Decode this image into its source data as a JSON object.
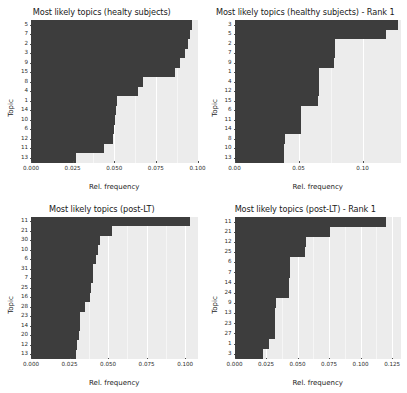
{
  "figure": {
    "background": "#ffffff",
    "panel_background": "#ececec",
    "bar_color": "#3d3d3d",
    "gridline_color": "#ffffff"
  },
  "chart_data": [
    {
      "id": "healthy-subjects",
      "type": "bar",
      "orientation": "horizontal",
      "title": "Most likely topics (healty subjects)",
      "xlabel": "Rel. frequency",
      "ylabel": "Topic",
      "xlim": [
        0,
        0.1
      ],
      "xticks": [
        0,
        0.025,
        0.05,
        0.075,
        0.1
      ],
      "xticklabels": [
        "0.000",
        "0.025",
        "0.050",
        "0.075",
        "0.100"
      ],
      "grid": true,
      "legend": "none",
      "categories": [
        "5",
        "7",
        "2",
        "3",
        "9",
        "15",
        "8",
        "4",
        "1",
        "14",
        "10",
        "6",
        "12",
        "11",
        "13"
      ],
      "values": [
        0.0965,
        0.0955,
        0.0945,
        0.0925,
        0.0895,
        0.0865,
        0.0675,
        0.0645,
        0.0515,
        0.051,
        0.0505,
        0.05,
        0.049,
        0.044,
        0.027
      ]
    },
    {
      "id": "healthy-subjects-rank1",
      "type": "bar",
      "orientation": "horizontal",
      "title": "Most likely topics (healthy subjects) - Rank 1",
      "xlabel": "Rel. frequency",
      "ylabel": "Topic",
      "xlim": [
        0,
        0.13
      ],
      "xticks": [
        0,
        0.05,
        0.1
      ],
      "xticklabels": [
        "0.00",
        "0.05",
        "0.10"
      ],
      "grid": true,
      "legend": "none",
      "categories": [
        "3",
        "5",
        "2",
        "7",
        "9",
        "1",
        "4",
        "12",
        "15",
        "6",
        "11",
        "14",
        "8",
        "10",
        "13"
      ],
      "values": [
        0.1275,
        0.118,
        0.0785,
        0.0785,
        0.078,
        0.066,
        0.066,
        0.066,
        0.0655,
        0.052,
        0.052,
        0.052,
        0.0395,
        0.039,
        0.039
      ]
    },
    {
      "id": "post-lt",
      "type": "bar",
      "orientation": "horizontal",
      "title": "Most likely topics (post-LT)",
      "xlabel": "Rel. frequency",
      "ylabel": "Topic",
      "xlim": [
        0,
        0.108
      ],
      "xticks": [
        0,
        0.025,
        0.05,
        0.075,
        0.1
      ],
      "xticklabels": [
        "0.000",
        "0.025",
        "0.050",
        "0.075",
        "0.100"
      ],
      "grid": true,
      "legend": "none",
      "categories": [
        "11",
        "21",
        "30",
        "10",
        "6",
        "31",
        "7",
        "25",
        "16",
        "28",
        "23",
        "14",
        "20",
        "12",
        "13"
      ],
      "values": [
        0.103,
        0.0525,
        0.045,
        0.0435,
        0.042,
        0.0405,
        0.04,
        0.039,
        0.0385,
        0.035,
        0.032,
        0.0315,
        0.031,
        0.03,
        0.029
      ]
    },
    {
      "id": "post-lt-rank1",
      "type": "bar",
      "orientation": "horizontal",
      "title": "Most likely topics (post-LT) - Rank 1",
      "xlabel": "Rel. frequency",
      "ylabel": "Topic",
      "xlim": [
        0,
        0.132
      ],
      "xticks": [
        0,
        0.025,
        0.05,
        0.075,
        0.1,
        0.125
      ],
      "xticklabels": [
        "0.000",
        "0.025",
        "0.050",
        "0.075",
        "0.100",
        "0.125"
      ],
      "grid": true,
      "legend": "none",
      "categories": [
        "11",
        "21",
        "12",
        "25",
        "6",
        "7",
        "14",
        "24",
        "9",
        "13",
        "23",
        "27",
        "1",
        "3"
      ],
      "values": [
        0.12,
        0.076,
        0.0565,
        0.0555,
        0.044,
        0.044,
        0.0435,
        0.043,
        0.033,
        0.0325,
        0.0325,
        0.0325,
        0.027,
        0.0225
      ]
    }
  ]
}
